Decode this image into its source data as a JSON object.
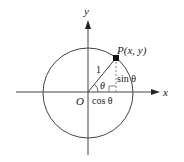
{
  "diagram": {
    "type": "unit-circle",
    "axes": {
      "x_label": "x",
      "y_label": "y"
    },
    "origin_label": "O",
    "point_label": "P(x, y)",
    "radius_label": "1",
    "angle_label": "θ",
    "vertical_segment_label": "sin θ",
    "horizontal_segment_label": "cos θ",
    "colors": {
      "stroke": "#333333",
      "dashed": "#888888",
      "text": "#1a1a1a",
      "background": "#ffffff"
    }
  }
}
